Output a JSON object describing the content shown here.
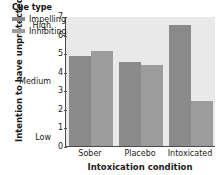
{
  "chart_data": {
    "type": "bar",
    "title": "",
    "categories": [
      "Sober",
      "Placebo",
      "Intoxicated"
    ],
    "series": [
      {
        "name": "Impelling",
        "values": [
          4.85,
          4.55,
          6.5
        ],
        "color": "#8a8a8a"
      },
      {
        "name": "Inhibiting",
        "values": [
          5.1,
          4.35,
          2.4
        ],
        "color": "#9c9c9c"
      }
    ],
    "xlabel": "Intoxication condition",
    "ylabel": "Intention to have unprotected sex",
    "ylim": [
      0,
      7
    ],
    "yticks": [
      0,
      1,
      2,
      3,
      4,
      5,
      6,
      7
    ],
    "ytick_labels": [
      "0",
      "1",
      "2",
      "3",
      "4",
      "5",
      "6",
      "7"
    ],
    "y_word_ticks": [
      {
        "label": "Low",
        "value": 0.5
      },
      {
        "label": "Medium",
        "value": 3.5
      },
      {
        "label": "High",
        "value": 6.5
      }
    ],
    "grid": false,
    "legend": {
      "title": "Cue type",
      "position": "upper-left-inside",
      "entries": [
        "Impelling",
        "Inhibiting"
      ]
    },
    "plot_background": "#e9e9e9",
    "figure_background": "#ffffff"
  }
}
